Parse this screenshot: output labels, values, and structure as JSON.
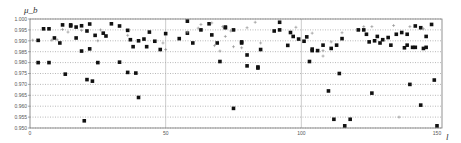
{
  "chart_data": {
    "type": "scatter",
    "title": "",
    "xlabel": "l",
    "ylabel": "μ_b",
    "xlim": [
      0,
      150
    ],
    "ylim": [
      0.95,
      1.0
    ],
    "x_ticks": [
      0,
      50,
      100,
      150
    ],
    "y_ticks": [
      0.95,
      0.955,
      0.96,
      0.965,
      0.97,
      0.975,
      0.98,
      0.985,
      0.99,
      0.995,
      1.0
    ],
    "y_tick_labels": [
      "0.950",
      "0.955",
      "0.960",
      "0.965",
      "0.970",
      "0.975",
      "0.980",
      "0.985",
      "0.990",
      "0.995",
      "1.000"
    ],
    "x_tick_labels": [
      "0",
      "50",
      "100",
      "150"
    ],
    "grid": {
      "horizontal": "dotted",
      "vertical": "solid at 50,100"
    },
    "legend": null,
    "series": [
      {
        "name": "squares",
        "marker": "square",
        "points": [
          [
            3,
            0.9902
          ],
          [
            3,
            0.98
          ],
          [
            5,
            0.9955
          ],
          [
            7,
            0.9955
          ],
          [
            7,
            0.98
          ],
          [
            9,
            0.9913
          ],
          [
            11,
            0.989
          ],
          [
            12,
            0.9973
          ],
          [
            13,
            0.9747
          ],
          [
            15,
            0.9973
          ],
          [
            17,
            0.9963
          ],
          [
            17,
            0.9913
          ],
          [
            15,
            0.9968
          ],
          [
            19,
            0.9969
          ],
          [
            19,
            0.9853
          ],
          [
            22,
            0.9977
          ],
          [
            22,
            0.9863
          ],
          [
            21,
            0.9722
          ],
          [
            23,
            0.9715
          ],
          [
            21,
            0.9945
          ],
          [
            24,
            0.9925
          ],
          [
            27,
            0.9935
          ],
          [
            28,
            0.9922
          ],
          [
            20,
            0.9533
          ],
          [
            25,
            0.98
          ],
          [
            30,
            0.9978
          ],
          [
            33,
            0.9968
          ],
          [
            36,
            0.9948
          ],
          [
            37,
            0.9905
          ],
          [
            40,
            0.99
          ],
          [
            33,
            0.9802
          ],
          [
            38,
            0.9873
          ],
          [
            39,
            0.9752
          ],
          [
            44,
            0.994
          ],
          [
            42,
            0.9908
          ],
          [
            46,
            0.9898
          ],
          [
            43,
            0.9873
          ],
          [
            48,
            0.986
          ],
          [
            36,
            0.9755
          ],
          [
            40,
            0.964
          ],
          [
            58,
            0.999
          ],
          [
            58,
            0.9935
          ],
          [
            55,
            0.991
          ],
          [
            50,
            0.9933
          ],
          [
            60,
            0.989
          ],
          [
            63,
            0.995
          ],
          [
            66,
            0.9978
          ],
          [
            67,
            0.9927
          ],
          [
            72,
            0.996
          ],
          [
            69,
            0.989
          ],
          [
            72,
            0.9963
          ],
          [
            75,
            0.995
          ],
          [
            78,
            0.989
          ],
          [
            78,
            0.9895
          ],
          [
            80,
            0.9785
          ],
          [
            70,
            0.9805
          ],
          [
            80,
            0.9835
          ],
          [
            84,
            0.9775
          ],
          [
            85,
            0.986
          ],
          [
            84,
            0.978
          ],
          [
            75,
            0.959
          ],
          [
            90,
            0.9945
          ],
          [
            92,
            0.9985
          ],
          [
            92,
            0.995
          ],
          [
            96,
            0.9938
          ],
          [
            97,
            0.992
          ],
          [
            99,
            0.9908
          ],
          [
            95,
            0.9879
          ],
          [
            101,
            0.9898
          ],
          [
            102,
            0.9918
          ],
          [
            104,
            0.9862
          ],
          [
            106,
            0.9855
          ],
          [
            103,
            0.9805
          ],
          [
            104,
            0.9855
          ],
          [
            108,
            0.988
          ],
          [
            110,
            0.967
          ],
          [
            112,
            0.954
          ],
          [
            114,
            0.975
          ],
          [
            116,
            0.951
          ],
          [
            118,
            0.954
          ],
          [
            111,
            0.9865
          ],
          [
            113,
            0.988
          ],
          [
            115,
            0.991
          ],
          [
            121,
            0.995
          ],
          [
            123,
            0.995
          ],
          [
            124,
            0.993
          ],
          [
            125,
            0.9895
          ],
          [
            127,
            0.99
          ],
          [
            129,
            0.989
          ],
          [
            128,
            0.992
          ],
          [
            130,
            0.9905
          ],
          [
            132,
            0.9915
          ],
          [
            133,
            0.988
          ],
          [
            135,
            0.993
          ],
          [
            137,
            0.9938
          ],
          [
            138,
            0.9868
          ],
          [
            139,
            0.993
          ],
          [
            142,
            0.9968
          ],
          [
            144,
            0.996
          ],
          [
            142,
            0.987
          ],
          [
            146,
            0.992
          ],
          [
            148,
            0.9975
          ],
          [
            146,
            0.987
          ],
          [
            145,
            0.9865
          ],
          [
            149,
            0.972
          ],
          [
            141,
            0.987
          ],
          [
            140,
            0.97
          ],
          [
            139,
            0.988
          ],
          [
            144,
            0.9605
          ],
          [
            150,
            0.951
          ],
          [
            126,
            0.966
          ]
        ]
      },
      {
        "name": "crosses",
        "marker": "plus",
        "points": [
          [
            1,
            0.9903
          ],
          [
            8,
            0.9903
          ],
          [
            10,
            0.9905
          ],
          [
            12,
            0.9952
          ],
          [
            14,
            0.994
          ],
          [
            19,
            0.9948
          ],
          [
            26,
            0.995
          ],
          [
            25,
            0.99
          ],
          [
            36,
            0.9925
          ],
          [
            49,
            0.989
          ],
          [
            50,
            0.986
          ],
          [
            58,
            0.994
          ],
          [
            63,
            0.9975
          ],
          [
            62,
            0.9958
          ],
          [
            67,
            0.9982
          ],
          [
            71,
            0.9965
          ],
          [
            72,
            0.992
          ],
          [
            74,
            0.9945
          ],
          [
            68,
            0.9878
          ],
          [
            70,
            0.9853
          ],
          [
            75,
            0.9873
          ],
          [
            78,
            0.9868
          ],
          [
            80,
            0.996
          ],
          [
            83,
            0.9985
          ],
          [
            85,
            0.989
          ],
          [
            98,
            0.9962
          ],
          [
            104,
            0.9935
          ],
          [
            108,
            0.9855
          ],
          [
            108,
            0.983
          ],
          [
            111,
            0.9895
          ],
          [
            115,
            0.9937
          ],
          [
            123,
            0.9965
          ],
          [
            126,
            0.9965
          ],
          [
            134,
            0.997
          ],
          [
            140,
            0.9965
          ],
          [
            145,
            0.9955
          ],
          [
            136,
            0.955
          ],
          [
            154,
            0.9995
          ]
        ]
      }
    ]
  }
}
